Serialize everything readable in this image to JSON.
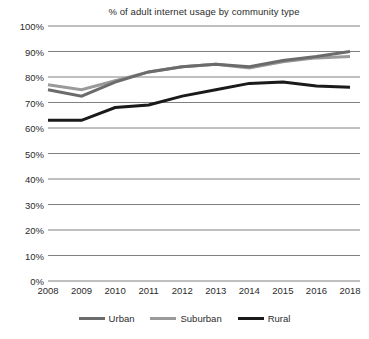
{
  "chart_data": {
    "type": "line",
    "title": "% of adult internet usage by community type",
    "xlabel": "",
    "ylabel": "",
    "categories": [
      "2008",
      "2009",
      "2010",
      "2011",
      "2012",
      "2013",
      "2014",
      "2015",
      "2016",
      "2018"
    ],
    "series": [
      {
        "name": "Urban",
        "color": "#6b6b6b",
        "values": [
          75,
          72.5,
          78,
          82,
          84,
          85,
          84,
          86.5,
          88,
          90
        ]
      },
      {
        "name": "Suburban",
        "color": "#9a9a9a",
        "values": [
          77,
          75,
          78.5,
          82,
          84,
          85,
          83.5,
          86,
          87.5,
          88
        ]
      },
      {
        "name": "Rural",
        "color": "#1a1a1a",
        "values": [
          63,
          63,
          68,
          69,
          72.5,
          75,
          77.5,
          78,
          76.5,
          76
        ]
      }
    ],
    "ylim": [
      0,
      100
    ],
    "ytick_labels": [
      "0%",
      "10%",
      "20%",
      "30%",
      "40%",
      "50%",
      "60%",
      "70%",
      "80%",
      "90%",
      "100%"
    ],
    "ytick_values": [
      0,
      10,
      20,
      30,
      40,
      50,
      60,
      70,
      80,
      90,
      100
    ],
    "grid": true,
    "grid_color": "#808080",
    "legend_position": "bottom",
    "background_color": "#ffffff"
  }
}
